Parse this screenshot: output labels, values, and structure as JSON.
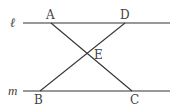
{
  "diagram": {
    "lines": {
      "l": {
        "label": "ℓ",
        "y": 23,
        "x1": 23,
        "x2": 170
      },
      "m": {
        "label": "m",
        "y": 91,
        "x1": 23,
        "x2": 170
      }
    },
    "points": {
      "A": {
        "label": "A",
        "x": 51,
        "y": 23
      },
      "D": {
        "label": "D",
        "x": 125,
        "y": 23
      },
      "B": {
        "label": "B",
        "x": 40,
        "y": 91
      },
      "C": {
        "label": "C",
        "x": 132,
        "y": 91
      },
      "E": {
        "label": "E",
        "x": 87,
        "y": 53
      }
    },
    "segments": [
      {
        "from": "A",
        "to": "C"
      },
      {
        "from": "D",
        "to": "B"
      }
    ],
    "stroke_color": "#333333",
    "label_color": "#444444"
  }
}
